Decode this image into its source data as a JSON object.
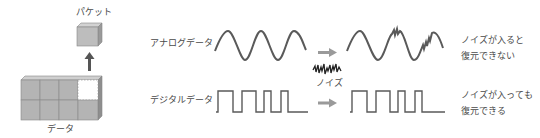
{
  "left_panel": {
    "packet_label": "パケット",
    "data_label": "データ"
  },
  "rows": [
    {
      "label": "アナログデータ",
      "result_line1": "ノイズが入ると",
      "result_line2": "復元できない"
    },
    {
      "label": "デジタルデータ",
      "result_line1": "ノイズが入っても",
      "result_line2": "復元できる"
    }
  ],
  "noise_label": "ノイズ",
  "colors": {
    "cube_fill": "#b4b4b4",
    "cube_top": "#cfcfcf",
    "cube_side": "#8e8e8e",
    "stroke": "#5a5a5a",
    "arrow": "#9a9a9a",
    "up_arrow": "#555555"
  }
}
